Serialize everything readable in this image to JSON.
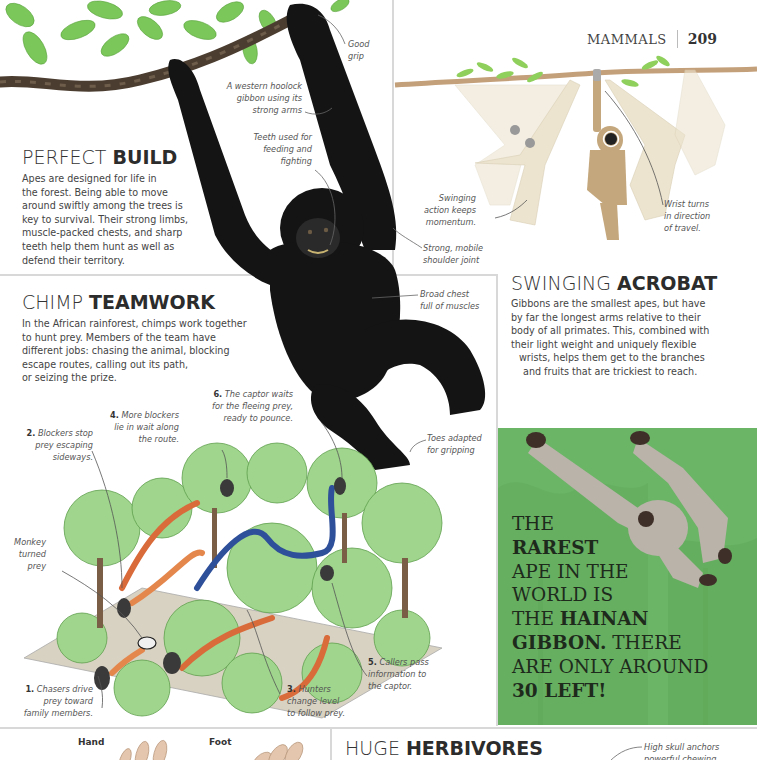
{
  "running_head": {
    "section": "MAMMALS",
    "page_number": "209"
  },
  "perfect_build": {
    "heading_light": "PERFECT",
    "heading_bold": "BUILD",
    "body": [
      "Apes are designed for life in",
      "the forest. Being able to move",
      "around swiftly among the trees is",
      "key to survival. Their strong limbs,",
      "muscle-packed chests, and sharp",
      "teeth help them hunt as well as",
      "defend their territory."
    ]
  },
  "gibbon_photo_labels": {
    "good_grip": [
      "Good",
      "grip"
    ],
    "caption": [
      "A western hoolock",
      "gibbon using its",
      "strong arms"
    ],
    "teeth": [
      "Teeth used for",
      "feeding and",
      "fighting"
    ],
    "shoulder": [
      "Strong, mobile",
      "shoulder joint"
    ],
    "chest": [
      "Broad chest",
      "full of muscles"
    ],
    "toes": [
      "Toes adapted",
      "for gripping"
    ]
  },
  "swing_diagram_labels": {
    "swinging": [
      "Swinging",
      "action keeps",
      "momentum."
    ],
    "wrist": [
      "Wrist turns",
      "in direction",
      "of travel."
    ]
  },
  "swinging_acrobat": {
    "heading_light": "SWINGING",
    "heading_bold": "ACROBAT",
    "body": [
      "Gibbons are the smallest apes, but have",
      "by far the longest arms relative to their",
      "body of all primates. This, combined with",
      "their light weight and uniquely flexible",
      "wrists, helps them get to the branches",
      "and fruits that are trickiest to reach."
    ]
  },
  "chimp_teamwork": {
    "heading_light": "CHIMP",
    "heading_bold": "TEAMWORK",
    "body": [
      "In the African rainforest, chimps work together",
      "to hunt prey. Members of the team have",
      "different jobs: chasing the animal, blocking",
      "escape routes, calling out its path,",
      "or seizing the prize."
    ],
    "steps": [
      {
        "num": "1.",
        "lines": [
          "Chasers drive",
          "prey toward",
          "family members."
        ]
      },
      {
        "num": "2.",
        "lines": [
          "Blockers stop",
          "prey escaping",
          "sideways."
        ]
      },
      {
        "num": "3.",
        "lines": [
          "Hunters",
          "change level",
          "to follow prey."
        ]
      },
      {
        "num": "4.",
        "lines": [
          "More blockers",
          "lie in wait along",
          "the route."
        ]
      },
      {
        "num": "5.",
        "lines": [
          "Callers pass",
          "information to",
          "the captor."
        ]
      },
      {
        "num": "6.",
        "lines": [
          "The captor waits",
          "for the fleeing prey,",
          "ready to pounce."
        ]
      }
    ],
    "monkey_label": [
      "Monkey",
      "turned",
      "prey"
    ]
  },
  "fact_box": {
    "lines": [
      [
        {
          "t": "The",
          "b": false
        }
      ],
      [
        {
          "t": "Rarest",
          "b": true
        }
      ],
      [
        {
          "t": "Ape in the",
          "b": false
        }
      ],
      [
        {
          "t": "World is",
          "b": false
        }
      ],
      [
        {
          "t": "The ",
          "b": false
        },
        {
          "t": "Hainan",
          "b": true
        }
      ],
      [
        {
          "t": "Gibbon.",
          "b": true
        },
        {
          "t": " There",
          "b": false
        }
      ],
      [
        {
          "t": "Are only around",
          "b": false
        }
      ],
      [
        {
          "t": "30 Left!",
          "b": true
        }
      ]
    ],
    "bg_color": "#6bb566"
  },
  "hands_feet": {
    "hand_label": "Hand",
    "foot_label": "Foot"
  },
  "huge_herbivores": {
    "heading_light": "HUGE",
    "heading_bold": "HERBIVORES",
    "skull_label": [
      "High skull anchors",
      "powerful chewing"
    ]
  }
}
